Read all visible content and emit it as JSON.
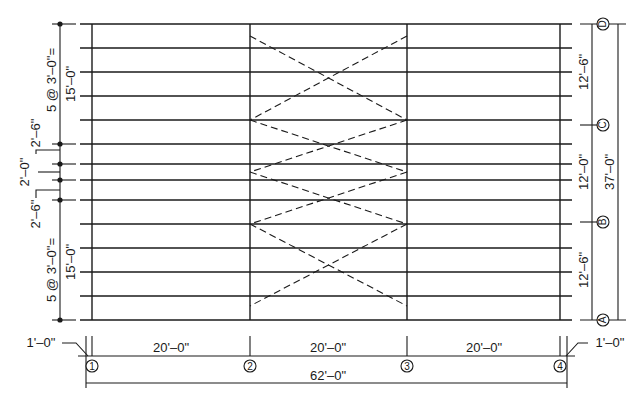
{
  "drawing": {
    "type": "structural framing plan",
    "colors": {
      "line": "#1a1a1a",
      "background": "#ffffff"
    }
  },
  "grid_columns": [
    {
      "label": "1",
      "x": 92
    },
    {
      "label": "2",
      "x": 250
    },
    {
      "label": "3",
      "x": 407
    },
    {
      "label": "4",
      "x": 560
    }
  ],
  "grid_rows": [
    {
      "label": "D",
      "y": 24
    },
    {
      "label": "C",
      "y": 125
    },
    {
      "label": "B",
      "y": 222
    },
    {
      "label": "A",
      "y": 320
    }
  ],
  "dimensions": {
    "bottom": {
      "bay_1": "20'–0\"",
      "bay_2": "20'–0\"",
      "bay_3": "20'–0\"",
      "overall": "62'–0\"",
      "left_overhang": "1'–0\"",
      "right_overhang": "1'–0\""
    },
    "right": {
      "d_to_c": "12'–6\"",
      "c_to_b": "12'–0\"",
      "b_to_a": "12'–6\"",
      "overall": "37'–0\""
    },
    "left": {
      "top_spacing": "5 @ 3'–0\"=",
      "top_total": "15'–0\"",
      "upper_gap": "2'–6\"",
      "middle_gap": "2'–0\"",
      "lower_gap": "2'–6\"",
      "bottom_spacing": "5 @ 3'–0\"=",
      "bottom_total": "15'–0\""
    }
  },
  "joist_lines_y": [
    24,
    48,
    72,
    96,
    120,
    144,
    164,
    180,
    200,
    224,
    248,
    272,
    296,
    320
  ]
}
